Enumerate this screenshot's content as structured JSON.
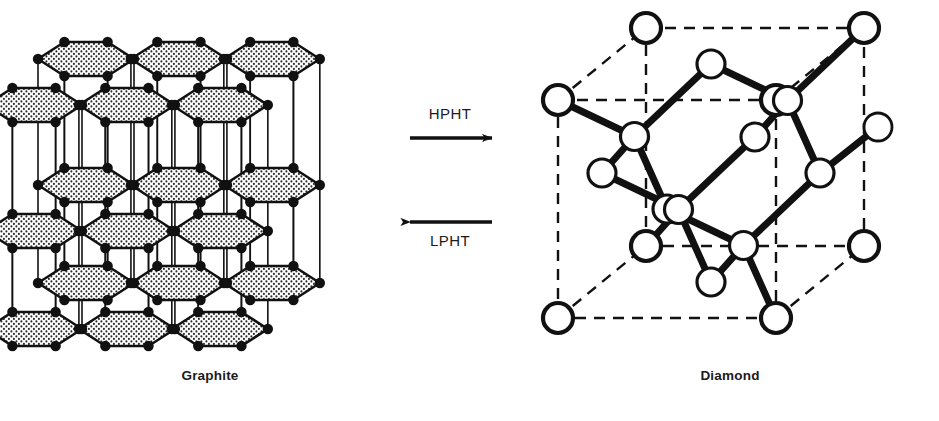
{
  "figure": {
    "background_color": "#ffffff",
    "ink_color": "#111111",
    "stipple_fill_color": "#e8e8e8",
    "width": 939,
    "height": 421
  },
  "captions": {
    "left_label": "Graphite",
    "right_label": "Diamond"
  },
  "arrows": {
    "forward": {
      "label": "HPHT",
      "direction": "right",
      "x1": 410,
      "y1": 138,
      "x2": 492,
      "y2": 138
    },
    "reverse": {
      "label": "LPHT",
      "direction": "left",
      "x1": 492,
      "y1": 222,
      "x2": 410,
      "y2": 222
    }
  },
  "graphite": {
    "name": "graphite-layered-structure",
    "layer_count": 3,
    "rows_per_layer": 2,
    "cols_per_row": 3,
    "atom_color": "#111111",
    "atom_radius": 5.2,
    "sheet_fill": "#ebebeb",
    "layer_tops": [
      32,
      158,
      256
    ],
    "origin_x": 38,
    "origin_y": 44,
    "hex_width": 96,
    "hex_half_height": 17,
    "row_step_x": -52,
    "row_step_y": 46,
    "pillar_color": "#111111"
  },
  "diamond": {
    "name": "diamond-cubic-unit-cell",
    "cube_style": "dashed",
    "atom_fill": "#ffffff",
    "atom_stroke": "#111111",
    "bond_color": "#111111",
    "corner_radius": 15,
    "inner_radius": 14,
    "cube": {
      "front_left": 558,
      "front_top": 100,
      "front_size": 218,
      "depth_x": 88,
      "depth_y": -72
    }
  }
}
